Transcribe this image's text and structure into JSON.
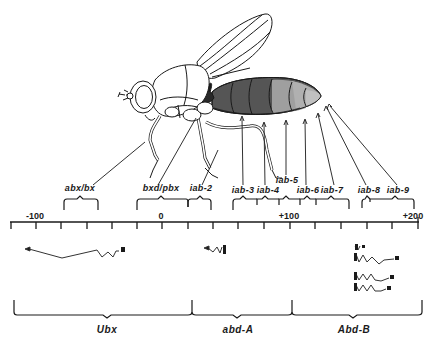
{
  "figure": {
    "colors": {
      "line": "#1a1a1a",
      "segment_dark": "#3a3a3a",
      "segment_mid": "#595959",
      "segment_light": "#9a9a9a",
      "segment_lighter": "#b5b5b5",
      "background": "#ffffff"
    }
  },
  "regulatory_regions": [
    {
      "label": "abx/bx"
    },
    {
      "label": "bxd/pbx"
    },
    {
      "label": "iab-2"
    },
    {
      "label": "iab-3"
    },
    {
      "label": "iab-4"
    },
    {
      "label": "iab-5"
    },
    {
      "label": "iab-6"
    },
    {
      "label": "iab-7"
    },
    {
      "label": "iab-8"
    },
    {
      "label": "iab-9"
    }
  ],
  "axis": {
    "tick_labels": [
      {
        "label": "-100"
      },
      {
        "label": "0"
      },
      {
        "label": "+100"
      },
      {
        "label": "+200"
      }
    ]
  },
  "genes": [
    {
      "label": "Ubx"
    },
    {
      "label": "abd-A"
    },
    {
      "label": "Abd-B"
    }
  ]
}
